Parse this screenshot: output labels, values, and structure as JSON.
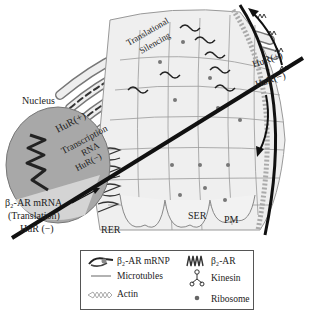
{
  "diagram": {
    "regions": {
      "nucleus": "Nucleus",
      "rer": "RER",
      "ser": "SER",
      "pm": "PM"
    },
    "annotations": {
      "translational_silencing_line1": "Translational",
      "translational_silencing_line2": "Silencing",
      "hur_plus_nucleus": "HuR(+)",
      "transcription": "Transcription",
      "rna": "RNA",
      "hur_minus_nucleus": "HuR(−)",
      "hur_plus_membrane": "HuR(+)",
      "hur_minus_membrane": "HuR(−)",
      "mrna_label_line1": "β₂-AR mRNA",
      "mrna_label_line2": "(Translation)",
      "mrna_label_line3": "HuR (−)"
    },
    "legend": {
      "items": [
        {
          "icon": "mrnp-icon",
          "label": "β₂-AR mRNP"
        },
        {
          "icon": "receptor-icon",
          "label": "β₂-AR"
        },
        {
          "icon": "microtubule-icon",
          "label": "Microtubles"
        },
        {
          "icon": "kinesin-icon",
          "label": "Kinesin"
        },
        {
          "icon": "actin-icon",
          "label": "Actin"
        },
        {
          "icon": "ribosome-icon",
          "label": "Ribosome"
        }
      ]
    },
    "colors": {
      "nucleus_fill": "#a8a8a8",
      "membrane_fill": "#e6e6e6",
      "line_dark": "#111111",
      "grid": "#888888"
    }
  }
}
